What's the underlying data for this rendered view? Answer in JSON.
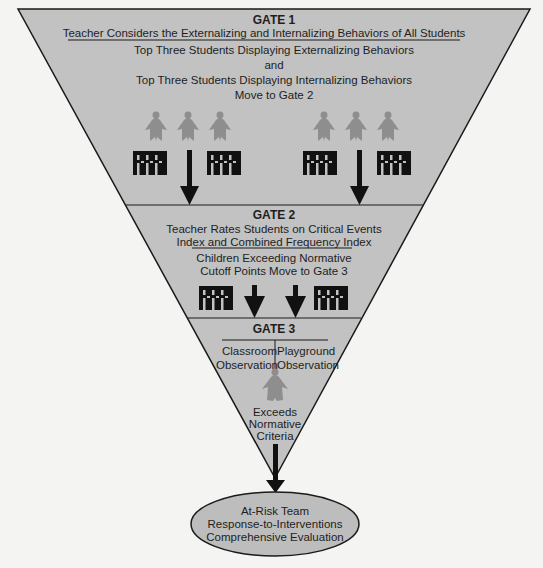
{
  "colors": {
    "funnel_fill": "#c2c2c2",
    "funnel_stroke": "#1a1a1a",
    "person_fill": "#8e8e8e",
    "block_fill": "#111111",
    "arrow_fill": "#111111",
    "ellipse_fill": "#bdbdbd",
    "background": "#f4f4f2"
  },
  "gate1": {
    "title": "GATE 1",
    "subtitle": "Teacher Considers the Externalizing and Internalizing Behaviors of All Students",
    "lines": [
      "Top Three Students Displaying Externalizing Behaviors",
      "and",
      "Top Three Students Displaying Internalizing Behaviors",
      "Move to Gate 2"
    ],
    "icons": {
      "left_group_people": 3,
      "right_group_people": 3,
      "class_roster_blocks": 4,
      "arrows": 2
    }
  },
  "gate2": {
    "title": "GATE 2",
    "subtitle_lines": [
      "Teacher Rates Students on Critical Events",
      "Index and Combined Frequency Index"
    ],
    "lines": [
      "Children Exceeding Normative",
      "Cutoff Points Move to Gate 3"
    ],
    "icons": {
      "class_roster_blocks": 2,
      "arrows": 2
    }
  },
  "gate3": {
    "title": "GATE 3",
    "left_column": [
      "Classroom",
      "Observation"
    ],
    "right_column": [
      "Playground",
      "Observation"
    ],
    "outcome_lines": [
      "Exceeds",
      "Normative",
      "Criteria"
    ]
  },
  "result": {
    "lines": [
      "At-Risk Team",
      "Response-to-Interventions",
      "Comprehensive Evaluation"
    ]
  }
}
